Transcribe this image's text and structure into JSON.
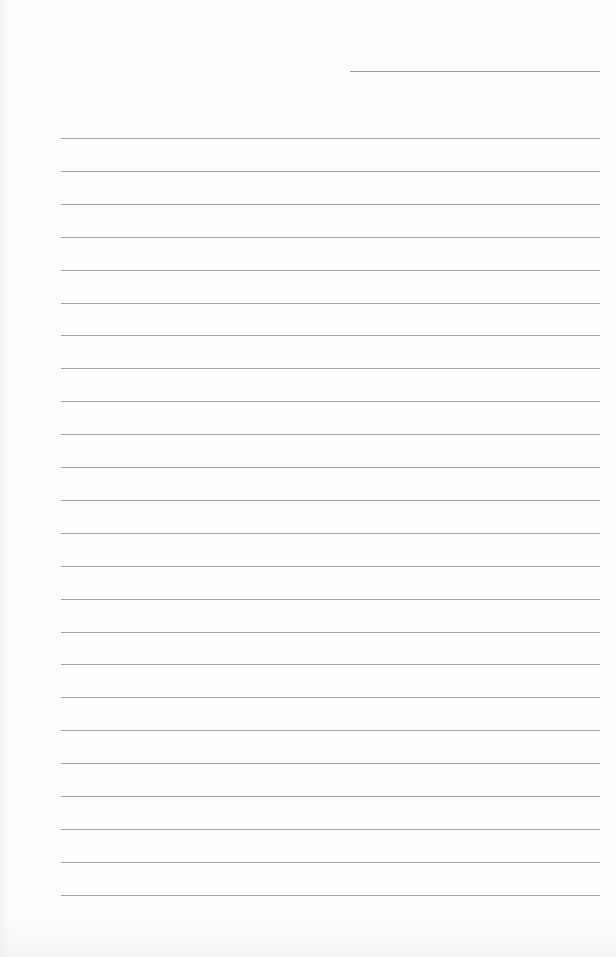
{
  "page": {
    "type": "lined-paper",
    "background_color": "#fefefe",
    "line_color": "#a3a3a3",
    "header_line": {
      "x": 350,
      "y": 71,
      "width": 250
    },
    "rules": {
      "count": 24,
      "first_y": 138,
      "spacing": 32.9,
      "left": 61,
      "width": 539
    }
  }
}
